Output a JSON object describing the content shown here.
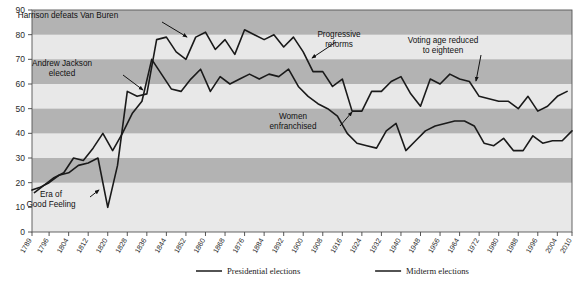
{
  "chart_data": {
    "type": "line",
    "title": "",
    "xlabel": "",
    "ylabel": "",
    "ylim": [
      0,
      90
    ],
    "ytick_step": 10,
    "yticks": [
      0,
      10,
      20,
      30,
      40,
      50,
      60,
      70,
      80,
      90
    ],
    "grid": "horizontal-alternating-bands",
    "band_color_dark": "#b3b3b3",
    "band_color_light": "#e8e8e8",
    "banded_ranges": [
      [
        20,
        30
      ],
      [
        40,
        50
      ],
      [
        60,
        70
      ],
      [
        80,
        90
      ]
    ],
    "xlim": [
      1789,
      2010
    ],
    "xticks": [
      1789,
      1796,
      1804,
      1812,
      1820,
      1828,
      1836,
      1844,
      1852,
      1860,
      1868,
      1876,
      1884,
      1892,
      1900,
      1908,
      1916,
      1924,
      1932,
      1940,
      1948,
      1956,
      1964,
      1972,
      1980,
      1988,
      1996,
      2004,
      2010
    ],
    "legend_position": "bottom-center",
    "line_color": "#1a1a1a",
    "series": [
      {
        "name": "Presidential elections",
        "color": "#1a1a1a",
        "x": [
          1789,
          1792,
          1796,
          1800,
          1804,
          1808,
          1812,
          1816,
          1820,
          1824,
          1828,
          1832,
          1836,
          1840,
          1844,
          1848,
          1852,
          1856,
          1860,
          1864,
          1868,
          1872,
          1876,
          1880,
          1884,
          1888,
          1892,
          1896,
          1900,
          1904,
          1908,
          1912,
          1916,
          1920,
          1924,
          1928,
          1932,
          1936,
          1940,
          1944,
          1948,
          1952,
          1956,
          1960,
          1964,
          1968,
          1972,
          1976,
          1980,
          1984,
          1988,
          1992,
          1996,
          2000,
          2004,
          2008
        ],
        "values": [
          17,
          18,
          20,
          23,
          24,
          27,
          28,
          30,
          10,
          27,
          57,
          55,
          56,
          78,
          79,
          73,
          70,
          79,
          81,
          74,
          78,
          72,
          82,
          80,
          78,
          80,
          75,
          79,
          73,
          65,
          65,
          59,
          62,
          49,
          49,
          57,
          57,
          61,
          63,
          56,
          51,
          62,
          60,
          64,
          62,
          61,
          55,
          54,
          53,
          53,
          50,
          55,
          49,
          51,
          55,
          57
        ]
      },
      {
        "name": "Midterm elections",
        "color": "#1a1a1a",
        "x": [
          1790,
          1794,
          1798,
          1802,
          1806,
          1810,
          1814,
          1818,
          1822,
          1826,
          1830,
          1834,
          1838,
          1842,
          1846,
          1850,
          1854,
          1858,
          1862,
          1866,
          1870,
          1874,
          1878,
          1882,
          1886,
          1890,
          1894,
          1898,
          1902,
          1906,
          1910,
          1914,
          1918,
          1922,
          1926,
          1930,
          1934,
          1938,
          1942,
          1946,
          1950,
          1954,
          1958,
          1962,
          1966,
          1970,
          1974,
          1978,
          1982,
          1986,
          1990,
          1994,
          1998,
          2002,
          2006,
          2010
        ],
        "values": [
          16,
          19,
          22,
          24,
          30,
          29,
          34,
          40,
          33,
          40,
          48,
          53,
          70,
          64,
          58,
          57,
          62,
          66,
          57,
          63,
          60,
          62,
          64,
          62,
          64,
          63,
          66,
          59,
          55,
          52,
          50,
          47,
          40,
          36,
          35,
          34,
          41,
          44,
          33,
          37,
          41,
          43,
          44,
          45,
          45,
          43,
          36,
          35,
          38,
          33,
          33,
          39,
          36,
          37,
          37,
          41
        ]
      }
    ],
    "annotations": [
      {
        "id": "harrison",
        "text_lines": [
          "Harrison defeats Van Buren"
        ],
        "label_x": 68,
        "label_y": 18,
        "arrow_from_x": 162,
        "arrow_from_y": 22,
        "arrow_to_x": 187,
        "arrow_to_y": 37
      },
      {
        "id": "jackson",
        "text_lines": [
          "Andrew Jackson",
          "elected"
        ],
        "label_x": 62,
        "label_y": 66,
        "arrow_from_x": 123,
        "arrow_from_y": 75,
        "arrow_to_x": 143,
        "arrow_to_y": 90
      },
      {
        "id": "era-good-feeling",
        "text_lines": [
          "Era of",
          "Good Feeling"
        ],
        "label_x": 51,
        "label_y": 197,
        "arrow_from_x": 90,
        "arrow_from_y": 197,
        "arrow_to_x": 99,
        "arrow_to_y": 190
      },
      {
        "id": "progressive-reforms",
        "text_lines": [
          "Progressive",
          "reforms"
        ],
        "label_x": 339,
        "label_y": 37,
        "arrow_from_x": 336,
        "arrow_from_y": 42,
        "arrow_to_x": 312,
        "arrow_to_y": 58
      },
      {
        "id": "women-enfranchised",
        "text_lines": [
          "Women",
          "enfranchised"
        ],
        "label_x": 293,
        "label_y": 119,
        "arrow_from_x": 340,
        "arrow_from_y": 126,
        "arrow_to_x": 352,
        "arrow_to_y": 112
      },
      {
        "id": "voting-age",
        "text_lines": [
          "Voting age reduced",
          "to eighteen"
        ],
        "label_x": 443,
        "label_y": 43,
        "arrow_from_x": 481,
        "arrow_from_y": 55,
        "arrow_to_x": 476,
        "arrow_to_y": 81
      }
    ]
  },
  "legend": {
    "items": [
      {
        "label": "Presidential elections",
        "color": "#1a1a1a"
      },
      {
        "label": "Midterm elections",
        "color": "#1a1a1a"
      }
    ]
  },
  "plot_geometry": {
    "left": 32,
    "top": 10,
    "right": 572,
    "bottom": 232
  }
}
